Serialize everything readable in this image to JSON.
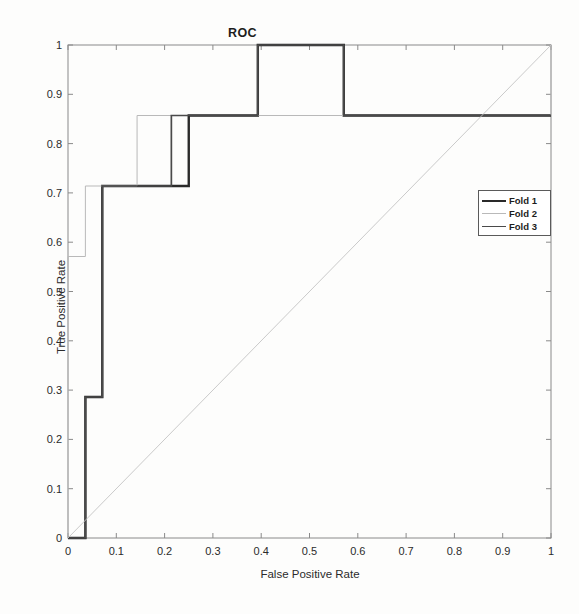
{
  "figure": {
    "title": "ROC",
    "background": "#fdfdfc"
  },
  "axes": {
    "xlabel": "False Positive Rate",
    "ylabel": "True Positive Rate",
    "xticks": [
      "0",
      "0.1",
      "0.2",
      "0.3",
      "0.4",
      "0.5",
      "0.6",
      "0.7",
      "0.8",
      "0.9",
      "1"
    ],
    "yticks": [
      "0",
      "0.1",
      "0.2",
      "0.3",
      "0.4",
      "0.5",
      "0.6",
      "0.7",
      "0.8",
      "0.9",
      "1"
    ],
    "xlim": [
      0,
      1
    ],
    "ylim": [
      0,
      1
    ],
    "grid": false,
    "box": true
  },
  "legend": {
    "position": "right-middle",
    "entries": [
      {
        "label": "Fold 1",
        "color": "#2a2a2a",
        "width": 2.2,
        "style": "solid"
      },
      {
        "label": "Fold 2",
        "color": "#b9b9b9",
        "width": 1.0,
        "style": "solid"
      },
      {
        "label": "Fold 3",
        "color": "#4a4a4a",
        "width": 1.6,
        "style": "solid"
      }
    ]
  },
  "colors": {
    "fold1": "#2a2a2a",
    "fold2": "#b9b9b9",
    "fold3": "#4a4a4a",
    "diagonal": "#c4c4c4",
    "axis": "#808080",
    "text": "#2b2b2b"
  },
  "caption": "",
  "chart_data": {
    "type": "line",
    "title": "ROC",
    "xlabel": "False Positive Rate",
    "ylabel": "True Positive Rate",
    "xlim": [
      0,
      1
    ],
    "ylim": [
      0,
      1
    ],
    "grid": false,
    "legend_position": "right-middle",
    "step_style": "post",
    "series": [
      {
        "name": "Fold 1",
        "color": "#2a2a2a",
        "x": [
          0,
          0.036,
          0.036,
          0.071,
          0.071,
          0.25,
          0.25,
          0.393,
          0.393,
          0.571,
          0.571,
          1
        ],
        "y": [
          0,
          0,
          0.286,
          0.286,
          0.714,
          0.714,
          0.857,
          0.857,
          1,
          1,
          0.857,
          0.857
        ]
      },
      {
        "name": "Fold 2",
        "color": "#b9b9b9",
        "x": [
          0,
          0,
          0.036,
          0.036,
          0.143,
          0.143,
          1,
          1
        ],
        "y": [
          0,
          0.571,
          0.571,
          0.714,
          0.714,
          0.857,
          0.857,
          1
        ]
      },
      {
        "name": "Fold 3",
        "color": "#4a4a4a",
        "x": [
          0,
          0.036,
          0.036,
          0.071,
          0.071,
          0.214,
          0.214,
          0.393,
          0.393,
          0.571,
          0.571,
          1
        ],
        "y": [
          0,
          0,
          0.286,
          0.286,
          0.714,
          0.714,
          0.857,
          0.857,
          1,
          1,
          0.857,
          0.857
        ]
      },
      {
        "name": "Chance diagonal",
        "color": "#c4c4c4",
        "x": [
          0,
          1
        ],
        "y": [
          0,
          1
        ]
      }
    ]
  }
}
